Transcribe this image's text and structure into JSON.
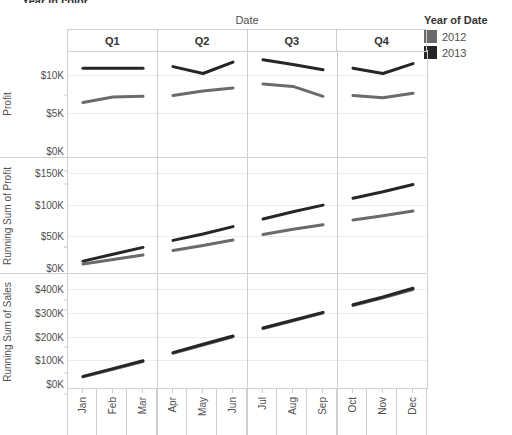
{
  "window": {
    "cropped_top_text": "Year in color"
  },
  "legend": {
    "title": "Year of Date",
    "items": [
      {
        "label": "2012",
        "color": "#6b6b6b"
      },
      {
        "label": "2013",
        "color": "#262626"
      }
    ]
  },
  "columns": {
    "axis_title": "Date",
    "headers": [
      "Q1",
      "Q2",
      "Q3",
      "Q4"
    ]
  },
  "months": [
    "Jan",
    "Feb",
    "Mar",
    "Apr",
    "May",
    "Jun",
    "Jul",
    "Aug",
    "Sep",
    "Oct",
    "Nov",
    "Dec"
  ],
  "chart_data": [
    {
      "type": "line",
      "title": "Profit",
      "panel_index": 0,
      "row_label": "Profit",
      "xlabel": "Date",
      "ylabel": "Profit",
      "ylim": [
        0,
        12500
      ],
      "yticks": [
        0,
        5000,
        10000
      ],
      "ytick_labels": [
        "$0K",
        "$5K",
        "$10K"
      ],
      "grid": true,
      "legend_position": "right",
      "x": [
        "Jan",
        "Feb",
        "Mar",
        "Apr",
        "May",
        "Jun",
        "Jul",
        "Aug",
        "Sep",
        "Oct",
        "Nov",
        "Dec"
      ],
      "quarters": [
        "Q1",
        "Q2",
        "Q3",
        "Q4"
      ],
      "series": [
        {
          "name": "2012",
          "color": "#6b6b6b",
          "values": [
            6400,
            7100,
            7200,
            7300,
            7900,
            8300,
            8800,
            8500,
            7200,
            7300,
            7000,
            7600
          ]
        },
        {
          "name": "2013",
          "color": "#262626",
          "values": [
            10900,
            10900,
            10900,
            11100,
            10200,
            11700,
            12000,
            11400,
            10700,
            10900,
            10200,
            11500
          ]
        }
      ]
    },
    {
      "type": "line",
      "title": "Running Sum of Profit",
      "panel_index": 1,
      "row_label": "Running Sum of Profit",
      "xlabel": "Date",
      "ylabel": "Running Sum of Profit",
      "ylim": [
        0,
        165000
      ],
      "yticks": [
        0,
        50000,
        100000,
        150000
      ],
      "ytick_labels": [
        "$0K",
        "$50K",
        "$100K",
        "$150K"
      ],
      "grid": true,
      "legend_position": "right",
      "x": [
        "Jan",
        "Feb",
        "Mar",
        "Apr",
        "May",
        "Jun",
        "Jul",
        "Aug",
        "Sep",
        "Oct",
        "Nov",
        "Dec"
      ],
      "quarters": [
        "Q1",
        "Q2",
        "Q3",
        "Q4"
      ],
      "series": [
        {
          "name": "2012",
          "color": "#6b6b6b",
          "values": [
            6400,
            13500,
            20700,
            28000,
            35900,
            44200,
            53000,
            61500,
            68700,
            76000,
            83000,
            90600
          ]
        },
        {
          "name": "2013",
          "color": "#262626",
          "values": [
            10900,
            21800,
            32700,
            43800,
            54000,
            65700,
            77700,
            89100,
            99800,
            110700,
            120900,
            132400
          ]
        }
      ]
    },
    {
      "type": "line",
      "title": "Running Sum of Sales",
      "panel_index": 2,
      "row_label": "Running Sum of Sales",
      "xlabel": "Date",
      "ylabel": "Running Sum of Sales",
      "ylim": [
        0,
        440000
      ],
      "yticks": [
        0,
        100000,
        200000,
        300000,
        400000
      ],
      "ytick_labels": [
        "$0K",
        "$100K",
        "$200K",
        "$300K",
        "$400K"
      ],
      "grid": true,
      "legend_position": "right",
      "x": [
        "Jan",
        "Feb",
        "Mar",
        "Apr",
        "May",
        "Jun",
        "Jul",
        "Aug",
        "Sep",
        "Oct",
        "Nov",
        "Dec"
      ],
      "quarters": [
        "Q1",
        "Q2",
        "Q3",
        "Q4"
      ],
      "series": [
        {
          "name": "2012",
          "color": "#6b6b6b",
          "values": [
            30000,
            62000,
            95000,
            130000,
            165000,
            200000,
            235000,
            268000,
            300000,
            332000,
            365000,
            400000
          ]
        },
        {
          "name": "2013",
          "color": "#262626",
          "values": [
            32000,
            65000,
            98000,
            133000,
            168000,
            203000,
            237000,
            270000,
            303000,
            335000,
            368000,
            405000
          ]
        }
      ]
    }
  ]
}
